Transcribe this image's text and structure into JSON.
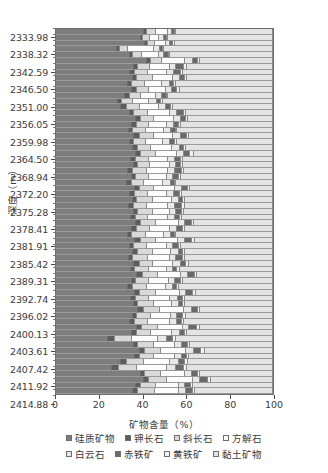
{
  "chart_data": {
    "type": "bar",
    "orientation": "horizontal",
    "stacked": true,
    "stack_mode": "percent",
    "title": "",
    "xlabel": "矿物含量（%）",
    "ylabel": "深度（m）",
    "xlim": [
      0,
      100
    ],
    "xticks": [
      "0",
      "20",
      "40",
      "60",
      "80",
      "100"
    ],
    "xtick_values": [
      0,
      20,
      40,
      60,
      80,
      100
    ],
    "grid": true,
    "legend_position": "bottom",
    "categories_axis": "depth (m)",
    "ytick_labels": [
      "2333.98",
      "2338.32",
      "2342.59",
      "2346.50",
      "2351.00",
      "2356.05",
      "2359.98",
      "2364.50",
      "2368.94",
      "2372.20",
      "2375.28",
      "2378.41",
      "2381.91",
      "2385.42",
      "2389.31",
      "2392.74",
      "2396.02",
      "2400.13",
      "2403.61",
      "2407.42",
      "2411.92",
      "2414.88"
    ],
    "series": [
      {
        "name": "硅质矿物",
        "color": "#7d7d7d"
      },
      {
        "name": "钾长石",
        "color": "#5c5c5c"
      },
      {
        "name": "斜长石",
        "color": "#d9d9d9"
      },
      {
        "name": "方解石",
        "color": "#fdfdfd"
      },
      {
        "name": "白云石",
        "color": "#e8e8e8"
      },
      {
        "name": "赤铁矿",
        "color": "#6a6a6a"
      },
      {
        "name": "黄铁矿",
        "color": "#f2f2f2"
      },
      {
        "name": "黏土矿物",
        "color": "#e4e4e4"
      }
    ],
    "rows": [
      {
        "depth": "2333.98",
        "values": [
          40.5,
          1.5,
          4.0,
          5.5,
          2.0,
          1.5,
          0.5,
          44.5
        ]
      },
      {
        "depth": "2334.9",
        "values": [
          39.0,
          1.0,
          3.5,
          4.0,
          2.5,
          1.0,
          0.5,
          48.5
        ]
      },
      {
        "depth": "2336.1",
        "values": [
          41.0,
          1.5,
          3.0,
          5.0,
          2.0,
          1.5,
          1.0,
          45.0
        ]
      },
      {
        "depth": "2338.32",
        "values": [
          28.0,
          1.5,
          3.5,
          12.0,
          3.0,
          1.5,
          0.5,
          50.0
        ]
      },
      {
        "depth": "2339.8",
        "values": [
          34.0,
          1.5,
          4.0,
          8.0,
          2.5,
          2.0,
          0.5,
          47.5
        ]
      },
      {
        "depth": "2341.2",
        "values": [
          42.0,
          2.0,
          5.0,
          10.5,
          3.5,
          2.5,
          1.0,
          33.5
        ]
      },
      {
        "depth": "2342.59",
        "values": [
          36.0,
          2.0,
          5.5,
          9.0,
          3.0,
          3.5,
          1.5,
          39.5
        ]
      },
      {
        "depth": "2343.8",
        "values": [
          34.0,
          2.5,
          6.0,
          8.5,
          3.5,
          3.0,
          1.0,
          41.5
        ]
      },
      {
        "depth": "2345.1",
        "values": [
          35.5,
          2.0,
          7.0,
          9.5,
          3.0,
          2.5,
          1.0,
          39.5
        ]
      },
      {
        "depth": "2346.50",
        "values": [
          33.0,
          2.0,
          6.0,
          8.0,
          3.5,
          2.0,
          1.0,
          44.5
        ]
      },
      {
        "depth": "2347.9",
        "values": [
          35.0,
          2.5,
          5.5,
          7.5,
          3.0,
          2.5,
          1.0,
          43.0
        ]
      },
      {
        "depth": "2349.4",
        "values": [
          32.0,
          2.0,
          5.0,
          7.0,
          3.0,
          2.0,
          0.5,
          48.5
        ]
      },
      {
        "depth": "2351.00",
        "values": [
          28.5,
          2.0,
          5.0,
          7.5,
          3.5,
          2.0,
          1.0,
          50.5
        ]
      },
      {
        "depth": "2352.6",
        "values": [
          30.0,
          2.5,
          6.0,
          9.0,
          3.0,
          2.5,
          1.0,
          46.0
        ]
      },
      {
        "depth": "2354.3",
        "values": [
          34.0,
          2.0,
          6.5,
          10.0,
          3.5,
          3.0,
          1.0,
          40.0
        ]
      },
      {
        "depth": "2356.05",
        "values": [
          37.0,
          2.0,
          6.0,
          9.5,
          3.0,
          2.5,
          1.0,
          39.0
        ]
      },
      {
        "depth": "2357.4",
        "values": [
          35.0,
          2.5,
          5.5,
          8.0,
          3.5,
          2.0,
          1.0,
          42.5
        ]
      },
      {
        "depth": "2358.7",
        "values": [
          33.5,
          2.0,
          6.0,
          8.5,
          3.0,
          2.5,
          0.5,
          44.0
        ]
      },
      {
        "depth": "2359.98",
        "values": [
          36.0,
          2.5,
          6.5,
          9.0,
          3.5,
          3.0,
          1.0,
          38.5
        ]
      },
      {
        "depth": "2361.4",
        "values": [
          34.0,
          2.0,
          5.5,
          8.0,
          3.0,
          2.5,
          1.0,
          44.0
        ]
      },
      {
        "depth": "2363.0",
        "values": [
          35.5,
          2.5,
          6.0,
          9.5,
          3.5,
          2.0,
          1.0,
          40.0
        ]
      },
      {
        "depth": "2364.50",
        "values": [
          37.0,
          2.0,
          7.0,
          10.0,
          3.0,
          3.0,
          1.5,
          36.5
        ]
      },
      {
        "depth": "2366.0",
        "values": [
          34.5,
          2.5,
          6.0,
          8.5,
          3.5,
          2.5,
          1.0,
          41.5
        ]
      },
      {
        "depth": "2367.5",
        "values": [
          36.0,
          2.0,
          5.5,
          9.0,
          3.0,
          2.0,
          1.0,
          41.5
        ]
      },
      {
        "depth": "2368.94",
        "values": [
          33.0,
          2.5,
          6.5,
          9.5,
          3.5,
          3.0,
          1.0,
          41.0
        ]
      },
      {
        "depth": "2370.5",
        "values": [
          35.0,
          2.0,
          6.0,
          8.0,
          3.0,
          2.5,
          1.0,
          42.5
        ]
      },
      {
        "depth": "2371.4",
        "values": [
          32.5,
          2.5,
          5.5,
          9.0,
          3.5,
          2.0,
          0.5,
          44.5
        ]
      },
      {
        "depth": "2372.20",
        "values": [
          36.5,
          2.0,
          6.5,
          10.0,
          3.0,
          3.0,
          1.0,
          38.0
        ]
      },
      {
        "depth": "2373.5",
        "values": [
          34.0,
          2.5,
          6.0,
          8.5,
          3.5,
          2.5,
          1.0,
          42.0
        ]
      },
      {
        "depth": "2374.4",
        "values": [
          35.5,
          2.0,
          7.0,
          9.0,
          3.0,
          2.0,
          1.0,
          40.5
        ]
      },
      {
        "depth": "2375.28",
        "values": [
          33.5,
          2.5,
          6.0,
          9.5,
          3.5,
          3.0,
          1.5,
          40.5
        ]
      },
      {
        "depth": "2376.6",
        "values": [
          36.0,
          2.0,
          6.5,
          8.0,
          3.0,
          2.5,
          1.0,
          41.0
        ]
      },
      {
        "depth": "2377.5",
        "values": [
          34.5,
          2.5,
          5.5,
          9.0,
          3.5,
          2.0,
          1.0,
          42.0
        ]
      },
      {
        "depth": "2378.41",
        "values": [
          37.0,
          2.0,
          7.0,
          10.5,
          3.0,
          3.0,
          1.0,
          36.5
        ]
      },
      {
        "depth": "2379.8",
        "values": [
          35.0,
          2.5,
          6.0,
          9.0,
          3.5,
          2.5,
          1.0,
          40.5
        ]
      },
      {
        "depth": "2380.9",
        "values": [
          33.0,
          2.0,
          6.5,
          8.5,
          3.0,
          2.0,
          0.5,
          44.5
        ]
      },
      {
        "depth": "2381.91",
        "values": [
          36.5,
          2.5,
          7.0,
          10.0,
          3.5,
          3.0,
          1.5,
          36.0
        ]
      },
      {
        "depth": "2383.0",
        "values": [
          34.0,
          2.0,
          6.0,
          9.0,
          3.0,
          2.5,
          1.0,
          42.5
        ]
      },
      {
        "depth": "2384.2",
        "values": [
          35.5,
          2.5,
          6.5,
          8.5,
          3.5,
          2.0,
          1.0,
          40.5
        ]
      },
      {
        "depth": "2385.42",
        "values": [
          33.5,
          2.0,
          7.0,
          10.0,
          3.0,
          3.0,
          1.0,
          40.5
        ]
      },
      {
        "depth": "2386.7",
        "values": [
          36.0,
          2.5,
          6.0,
          9.5,
          3.5,
          2.5,
          1.5,
          38.5
        ]
      },
      {
        "depth": "2388.0",
        "values": [
          34.5,
          2.0,
          6.5,
          8.0,
          3.0,
          2.0,
          1.0,
          43.0
        ]
      },
      {
        "depth": "2389.31",
        "values": [
          37.5,
          2.5,
          7.0,
          10.5,
          3.5,
          3.0,
          1.0,
          35.0
        ]
      },
      {
        "depth": "2390.5",
        "values": [
          35.0,
          2.0,
          6.0,
          9.0,
          3.0,
          2.5,
          1.0,
          41.5
        ]
      },
      {
        "depth": "2391.6",
        "values": [
          33.0,
          2.5,
          6.5,
          8.5,
          3.5,
          2.0,
          0.5,
          43.5
        ]
      },
      {
        "depth": "2392.74",
        "values": [
          36.5,
          2.0,
          7.5,
          11.0,
          3.0,
          3.0,
          1.5,
          35.5
        ]
      },
      {
        "depth": "2393.9",
        "values": [
          34.5,
          2.5,
          6.0,
          9.5,
          3.5,
          2.5,
          1.0,
          40.5
        ]
      },
      {
        "depth": "2395.0",
        "values": [
          36.0,
          2.0,
          7.0,
          8.5,
          3.0,
          2.0,
          1.0,
          40.5
        ]
      },
      {
        "depth": "2396.02",
        "values": [
          38.0,
          2.5,
          7.5,
          11.0,
          3.5,
          3.0,
          1.0,
          33.5
        ]
      },
      {
        "depth": "2397.5",
        "values": [
          35.5,
          2.0,
          6.5,
          9.0,
          3.0,
          2.5,
          1.5,
          40.0
        ]
      },
      {
        "depth": "2398.9",
        "values": [
          34.0,
          2.5,
          6.0,
          10.0,
          3.5,
          2.0,
          1.0,
          41.0
        ]
      },
      {
        "depth": "2400.13",
        "values": [
          37.5,
          2.0,
          7.5,
          11.5,
          3.0,
          3.5,
          1.5,
          33.5
        ]
      },
      {
        "depth": "2401.5",
        "values": [
          35.0,
          2.5,
          6.5,
          9.5,
          3.5,
          2.5,
          1.0,
          39.5
        ]
      },
      {
        "depth": "2402.6",
        "values": [
          24.0,
          3.0,
          8.0,
          12.0,
          4.0,
          3.0,
          1.5,
          44.5
        ]
      },
      {
        "depth": "2403.61",
        "values": [
          36.0,
          2.0,
          7.0,
          10.0,
          3.0,
          3.0,
          1.0,
          38.0
        ]
      },
      {
        "depth": "2405.0",
        "values": [
          38.5,
          2.5,
          7.5,
          11.5,
          3.5,
          3.5,
          1.5,
          31.5
        ]
      },
      {
        "depth": "2406.3",
        "values": [
          36.5,
          2.0,
          6.5,
          10.0,
          3.0,
          2.5,
          1.0,
          38.5
        ]
      },
      {
        "depth": "2407.42",
        "values": [
          30.0,
          2.5,
          8.0,
          12.0,
          4.0,
          3.0,
          1.5,
          39.0
        ]
      },
      {
        "depth": "2408.8",
        "values": [
          26.0,
          3.0,
          8.5,
          13.5,
          4.5,
          3.5,
          1.5,
          39.5
        ]
      },
      {
        "depth": "2410.2",
        "values": [
          39.0,
          2.0,
          7.5,
          11.0,
          3.0,
          3.0,
          1.0,
          33.5
        ]
      },
      {
        "depth": "2411.92",
        "values": [
          40.5,
          2.5,
          8.0,
          12.0,
          3.5,
          3.5,
          1.5,
          28.5
        ]
      },
      {
        "depth": "2413.4",
        "values": [
          37.0,
          2.0,
          7.0,
          10.5,
          3.0,
          2.5,
          1.0,
          37.0
        ]
      },
      {
        "depth": "2414.88",
        "values": [
          35.5,
          2.5,
          7.5,
          11.0,
          3.5,
          3.0,
          1.0,
          36.0
        ]
      }
    ]
  },
  "legend": {
    "row1": [
      {
        "label": "硅质矿物",
        "color": "#7d7d7d"
      },
      {
        "label": "钾长石",
        "color": "#5c5c5c"
      },
      {
        "label": "斜长石",
        "color": "#d9d9d9"
      },
      {
        "label": "方解石",
        "color": "#fdfdfd"
      }
    ],
    "row2": [
      {
        "label": "白云石",
        "color": "#e8e8e8"
      },
      {
        "label": "赤铁矿",
        "color": "#6a6a6a"
      },
      {
        "label": "黄铁矿",
        "color": "#f2f2f2"
      },
      {
        "label": "黏土矿物",
        "color": "#e4e4e4"
      }
    ]
  }
}
